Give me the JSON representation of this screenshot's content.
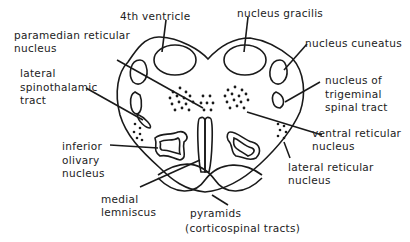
{
  "diagram": {
    "labels": {
      "fourth_ventricle": "4th ventricle",
      "nucleus_gracilis": "nucleus gracilis",
      "paramedian_reticular_1": "paramedian reticular",
      "paramedian_reticular_2": "nucleus",
      "nucleus_cuneatus": "nucleus cuneatus",
      "lateral_spinothalamic_1": "lateral",
      "lateral_spinothalamic_2": "spinothalamic",
      "lateral_spinothalamic_3": "tract",
      "trigeminal_1": "nucleus of",
      "trigeminal_2": "trigeminal",
      "trigeminal_3": "spinal tract",
      "ventral_reticular_1": "ventral reticular",
      "ventral_reticular_2": "nucleus",
      "inferior_olivary_1": "inferior",
      "inferior_olivary_2": "olivary",
      "inferior_olivary_3": "nucleus",
      "lateral_reticular_1": "lateral reticular",
      "lateral_reticular_2": "nucleus",
      "medial_lemniscus_1": "medial",
      "medial_lemniscus_2": "lemniscus",
      "pyramids_1": "pyramids",
      "pyramids_2": "(corticospinal tracts)"
    },
    "colors": {
      "line": "#1a1a1a",
      "background": "#ffffff"
    }
  }
}
